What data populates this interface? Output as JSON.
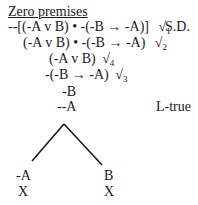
{
  "title": "Zero premises",
  "lines": [
    {
      "formula": "--[(-A v B) • -(-B → -A)]",
      "check": "√",
      "sub": "1",
      "rule": "S.D."
    },
    {
      "formula": "(-A v B) • -(-B → -A)",
      "check": "√",
      "sub": "2"
    },
    {
      "formula": "(-A v B)",
      "check": "√",
      "sub": "4"
    },
    {
      "formula": "-(-B → -A)",
      "check": "√",
      "sub": "3"
    },
    {
      "formula": "-B"
    },
    {
      "formula": "--A",
      "rule": "L-true"
    }
  ],
  "branches": [
    {
      "formula": "-A",
      "closed": "X"
    },
    {
      "formula": "B",
      "closed": "X"
    }
  ]
}
